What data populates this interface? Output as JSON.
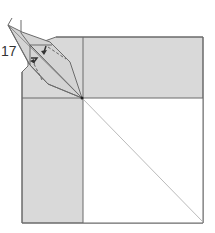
{
  "diagram": {
    "type": "origami-step",
    "step_number": "17",
    "colors": {
      "paper_colored": "#d9d9d9",
      "paper_white": "#ffffff",
      "edge": "#6b6b6b",
      "diagonal": "#bbbbbb",
      "flap": "#d4d4d4"
    },
    "elements": [
      "square base with cut top-left corner",
      "vertical crease line",
      "horizontal crease line",
      "diagonal valley crease to bottom-right corner",
      "elongated kite flap at top-left",
      "two fold arrows on flap",
      "center reference point"
    ]
  }
}
